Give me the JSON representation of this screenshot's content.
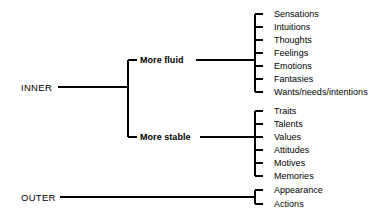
{
  "diagram": {
    "line_color": "#000000",
    "text_color": "#000000",
    "background": "#ffffff",
    "roots": [
      {
        "id": "inner",
        "label": "INNER",
        "label_x": 21,
        "label_y": 87,
        "connector": {
          "x1": 58,
          "y1": 87,
          "x2": 128,
          "y2": 87
        },
        "trunk": {
          "x": 128,
          "y1": 60,
          "y2": 137
        },
        "branches": [
          {
            "id": "more-fluid",
            "label": "More fluid",
            "label_x": 140,
            "label_y": 60,
            "tick": {
              "x1": 128,
              "y1": 60,
              "x2": 137,
              "y2": 60
            },
            "connector": {
              "x1": 196,
              "y1": 60,
              "x2": 255,
              "y2": 60
            },
            "bracket": {
              "x": 255,
              "y1": 14,
              "y2": 92
            },
            "leaves": [
              {
                "label": "Sensations",
                "y": 14
              },
              {
                "label": "Intuitions",
                "y": 27
              },
              {
                "label": "Thoughts",
                "y": 40
              },
              {
                "label": "Feelings",
                "y": 53
              },
              {
                "label": "Emotions",
                "y": 66
              },
              {
                "label": "Fantasies",
                "y": 79
              },
              {
                "label": "Wants/needs/intentions",
                "y": 92
              }
            ]
          },
          {
            "id": "more-stable",
            "label": "More stable",
            "label_x": 140,
            "label_y": 137,
            "tick": {
              "x1": 128,
              "y1": 137,
              "x2": 137,
              "y2": 137
            },
            "connector": {
              "x1": 200,
              "y1": 137,
              "x2": 255,
              "y2": 137
            },
            "bracket": {
              "x": 255,
              "y1": 111,
              "y2": 176
            },
            "leaves": [
              {
                "label": "Traits",
                "y": 111
              },
              {
                "label": "Talents",
                "y": 124
              },
              {
                "label": "Values",
                "y": 137
              },
              {
                "label": "Attitudes",
                "y": 150
              },
              {
                "label": "Motives",
                "y": 163
              },
              {
                "label": "Memories",
                "y": 176
              }
            ]
          }
        ]
      },
      {
        "id": "outer",
        "label": "OUTER",
        "label_x": 21,
        "label_y": 197,
        "connector": {
          "x1": 60,
          "y1": 197,
          "x2": 255,
          "y2": 197
        },
        "trunk": null,
        "branches": [
          {
            "id": "outer-direct",
            "label": "",
            "label_x": 0,
            "label_y": 0,
            "tick": null,
            "connector": null,
            "bracket": {
              "x": 255,
              "y1": 190,
              "y2": 204
            },
            "leaves": [
              {
                "label": "Appearance",
                "y": 190
              },
              {
                "label": "Actions",
                "y": 204
              }
            ]
          }
        ]
      }
    ],
    "geometry": {
      "leaf_tick_length": 8,
      "leaf_text_x": 274,
      "branch_tick_length": 9,
      "stroke_width": 1.1
    }
  }
}
